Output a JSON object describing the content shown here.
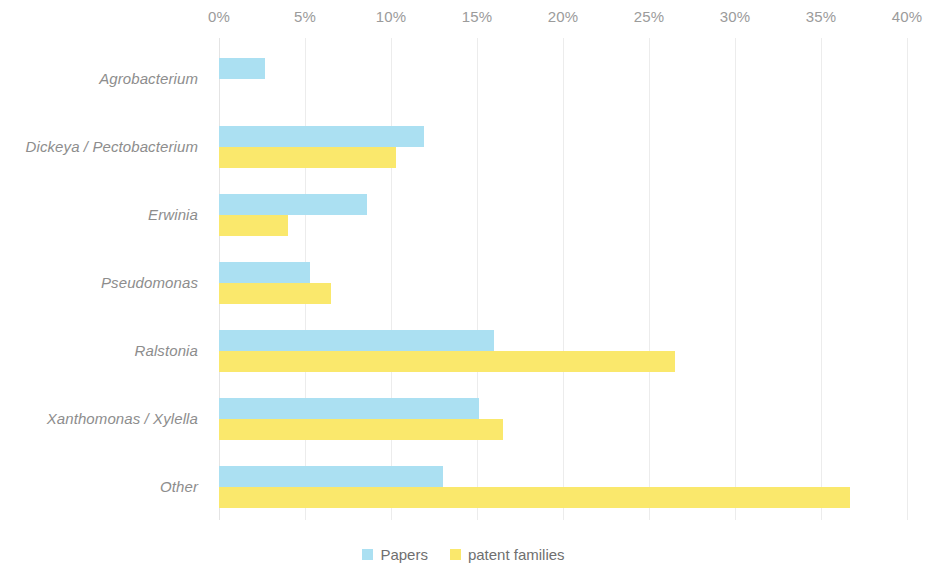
{
  "chart_data": {
    "type": "bar",
    "orientation": "horizontal",
    "title": "",
    "subtitle": "",
    "xlabel": "",
    "ylabel": "",
    "xlim": [
      0,
      40
    ],
    "xtick_labels": [
      "0%",
      "5%",
      "10%",
      "15%",
      "20%",
      "25%",
      "30%",
      "35%",
      "40%"
    ],
    "xtick_values": [
      0,
      5,
      10,
      15,
      20,
      25,
      30,
      35,
      40
    ],
    "grid": true,
    "legend_position": "bottom",
    "value_unit": "%",
    "categories": [
      "Agrobacterium",
      "Dickeya / Pectobacterium",
      "Erwinia",
      "Pseudomonas",
      "Ralstonia",
      "Xanthomonas / Xylella",
      "Other"
    ],
    "series": [
      {
        "name": "Papers",
        "color": "#abe0f2",
        "values": [
          2.7,
          11.9,
          8.6,
          5.3,
          16.0,
          15.1,
          13.0
        ]
      },
      {
        "name": "patent families",
        "color": "#fae86c",
        "values": [
          0.0,
          10.3,
          4.0,
          6.5,
          26.5,
          16.5,
          36.7
        ]
      }
    ]
  },
  "legend": {
    "items": [
      {
        "label": "Papers",
        "swatch": "papers"
      },
      {
        "label": "patent families",
        "swatch": "patents"
      }
    ]
  },
  "colors": {
    "papers": "#abe0f2",
    "patent_families": "#fae86c",
    "gridline": "#ececec",
    "axis_text": "#9b9b9b",
    "category_text": "#8d8d8d",
    "legend_text": "#6f6f6f",
    "background": "#ffffff"
  }
}
